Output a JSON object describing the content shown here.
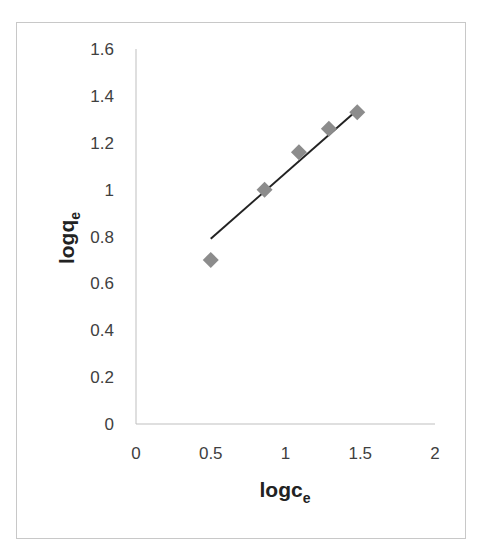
{
  "chart_data": {
    "type": "scatter",
    "title": "",
    "xlabel": "logc",
    "xlabel_subscript": "e",
    "ylabel": "logq",
    "ylabel_subscript": "e",
    "xlim": [
      0,
      2
    ],
    "ylim": [
      0,
      1.6
    ],
    "x_ticks": [
      "0",
      "0.5",
      "1",
      "1.5",
      "2"
    ],
    "y_ticks": [
      "0",
      "0.2",
      "0.4",
      "0.6",
      "0.8",
      "1",
      "1.2",
      "1.4",
      "1.6"
    ],
    "grid": false,
    "legend": null,
    "series": [
      {
        "name": "data",
        "marker": "diamond",
        "color": "#8c8c8c",
        "x": [
          0.5,
          0.86,
          1.09,
          1.29,
          1.48
        ],
        "y": [
          0.7,
          1.0,
          1.16,
          1.26,
          1.33
        ]
      }
    ],
    "trendline": {
      "type": "linear",
      "color": "#222222",
      "x_start": 0.5,
      "y_start": 0.79,
      "x_end": 1.48,
      "y_end": 1.34
    }
  },
  "colors": {
    "marker": "#8c8c8c",
    "trendline": "#222222",
    "axis": "#bfbfbf",
    "frame": "#c8c8c8",
    "text": "#404040"
  }
}
